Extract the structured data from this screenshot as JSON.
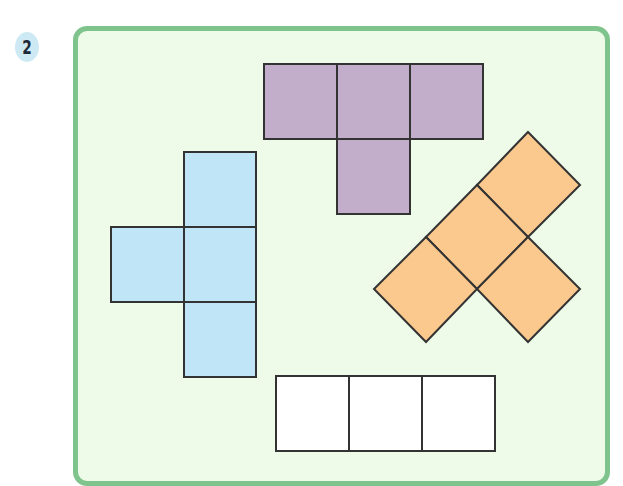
{
  "problem": {
    "number": "2"
  },
  "colors": {
    "frame_border": "#7fc48c",
    "frame_fill": "#eefbe8",
    "badge_fill": "#cdeaf4",
    "purple": "#c2aecb",
    "blue": "#bfe5f6",
    "orange": "#fbc88e",
    "white": "#ffffff",
    "outline": "#333333"
  },
  "shapes": [
    {
      "name": "purple-t-net",
      "color": "purple",
      "squares": 4
    },
    {
      "name": "blue-cross-net",
      "color": "blue",
      "squares": 4
    },
    {
      "name": "orange-rotated-net",
      "color": "orange",
      "squares": 4
    },
    {
      "name": "white-row",
      "color": "white",
      "squares": 3
    }
  ]
}
